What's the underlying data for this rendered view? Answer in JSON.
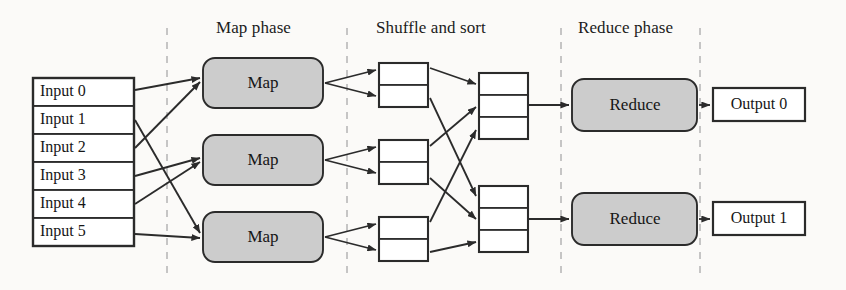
{
  "figure": {
    "background": "#fbfaf8",
    "width": 846,
    "height": 290
  },
  "phase_labels": [
    {
      "id": "map-phase",
      "text": "Map phase",
      "x": 216,
      "y": 18
    },
    {
      "id": "shuffle-phase",
      "text": "Shuffle and sort",
      "x": 376,
      "y": 18
    },
    {
      "id": "reduce-phase",
      "text": "Reduce phase",
      "x": 578,
      "y": 18
    }
  ],
  "inputs": {
    "name": "input-split-list",
    "items": [
      {
        "label": "Input 0"
      },
      {
        "label": "Input 1"
      },
      {
        "label": "Input 2"
      },
      {
        "label": "Input 3"
      },
      {
        "label": "Input 4"
      },
      {
        "label": "Input 5"
      }
    ]
  },
  "mappers": [
    {
      "label": "Map"
    },
    {
      "label": "Map"
    },
    {
      "label": "Map"
    }
  ],
  "reducers": [
    {
      "label": "Reduce"
    },
    {
      "label": "Reduce"
    }
  ],
  "outputs": [
    {
      "label": "Output 0"
    },
    {
      "label": "Output 1"
    }
  ],
  "intermediate": {
    "map_output_cells": 2,
    "reduce_input_cells": 3,
    "map_output_count": 3,
    "reduce_input_count": 2
  },
  "colors": {
    "stroke": "#2b2b2b",
    "node_fill": "#cccccc",
    "box_fill": "#ffffff",
    "divider": "#b8b8b8",
    "text": "#161616",
    "page": "#fbfaf8"
  },
  "dividers": [
    {
      "x": 167
    },
    {
      "x": 347
    },
    {
      "x": 561
    },
    {
      "x": 700
    }
  ]
}
